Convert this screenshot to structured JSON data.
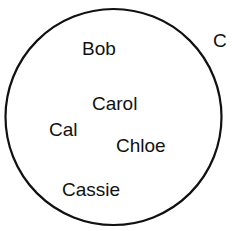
{
  "diagram": {
    "set_label": "C",
    "circle": {
      "cx": 113.5,
      "cy": 117,
      "r": 108,
      "stroke": "#111111"
    },
    "members": [
      {
        "name": "Bob",
        "x": 82,
        "y": 39
      },
      {
        "name": "Carol",
        "x": 92,
        "y": 94
      },
      {
        "name": "Cal",
        "x": 49,
        "y": 120
      },
      {
        "name": "Chloe",
        "x": 116,
        "y": 136
      },
      {
        "name": "Cassie",
        "x": 62,
        "y": 180
      }
    ],
    "label_pos": {
      "x": 213,
      "y": 31
    }
  }
}
